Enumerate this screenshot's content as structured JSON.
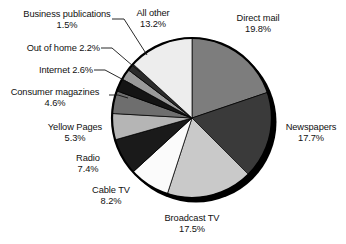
{
  "chart_data": {
    "type": "pie",
    "title": "",
    "categories": [
      "Direct mail",
      "Newspapers",
      "Broadcast TV",
      "Cable TV",
      "Radio",
      "Yellow Pages",
      "Consumer magazines",
      "Internet",
      "Out of home",
      "Business publications",
      "All other"
    ],
    "values": [
      19.8,
      17.7,
      17.5,
      8.2,
      7.4,
      5.3,
      4.6,
      2.6,
      2.2,
      1.5,
      13.2
    ],
    "value_suffix": "%",
    "legend": "none",
    "grid": false,
    "start_angle_deg": 0,
    "direction": "clockwise",
    "slice_colors": [
      "#7d7d7d",
      "#3a3a3a",
      "#c9c9c9",
      "#fbfbfb",
      "#1a1a1a",
      "#b5b5b5",
      "#6e6e6e",
      "#141414",
      "#9a9a9a",
      "#2b2b2b",
      "#ededed"
    ],
    "slices": [
      {
        "label": "Direct mail",
        "value": 19.8,
        "value_text": "19.8%",
        "color": "#7d7d7d"
      },
      {
        "label": "Newspapers",
        "value": 17.7,
        "value_text": "17.7%",
        "color": "#3a3a3a"
      },
      {
        "label": "Broadcast TV",
        "value": 17.5,
        "value_text": "17.5%",
        "color": "#c9c9c9"
      },
      {
        "label": "Cable TV",
        "value": 8.2,
        "value_text": "8.2%",
        "color": "#fbfbfb"
      },
      {
        "label": "Radio",
        "value": 7.4,
        "value_text": "7.4%",
        "color": "#1a1a1a"
      },
      {
        "label": "Yellow Pages",
        "value": 5.3,
        "value_text": "5.3%",
        "color": "#b5b5b5"
      },
      {
        "label": "Consumer magazines",
        "value": 4.6,
        "value_text": "4.6%",
        "color": "#6e6e6e"
      },
      {
        "label": "Internet",
        "value": 2.6,
        "value_text": "2.6%",
        "color": "#141414"
      },
      {
        "label": "Out of home",
        "value": 2.2,
        "value_text": "2.2%",
        "color": "#9a9a9a"
      },
      {
        "label": "Business publications",
        "value": 1.5,
        "value_text": "1.5%",
        "color": "#2b2b2b"
      },
      {
        "label": "All other",
        "value": 13.2,
        "value_text": "13.2%",
        "color": "#ededed"
      }
    ]
  },
  "labels": {
    "business_publications": {
      "name": "Business publications",
      "value": "1.5%"
    },
    "out_of_home": {
      "name": "Out of home 2.2%"
    },
    "internet": {
      "name": "Internet 2.6%"
    },
    "consumer_magazines": {
      "name": "Consumer magazines",
      "value": "4.6%"
    },
    "yellow_pages": {
      "name": "Yellow Pages",
      "value": "5.3%"
    },
    "radio": {
      "name": "Radio",
      "value": "7.4%"
    },
    "cable_tv": {
      "name": "Cable TV",
      "value": "8.2%"
    },
    "broadcast_tv": {
      "name": "Broadcast TV",
      "value": "17.5%"
    },
    "newspapers": {
      "name": "Newspapers",
      "value": "17.7%"
    },
    "direct_mail": {
      "name": "Direct mail",
      "value": "19.8%"
    },
    "all_other": {
      "name": "All other",
      "value": "13.2%"
    }
  },
  "colors": {
    "background": "#ffffff",
    "text": "#111111",
    "outline": "#000000",
    "shadow": "#000000"
  }
}
